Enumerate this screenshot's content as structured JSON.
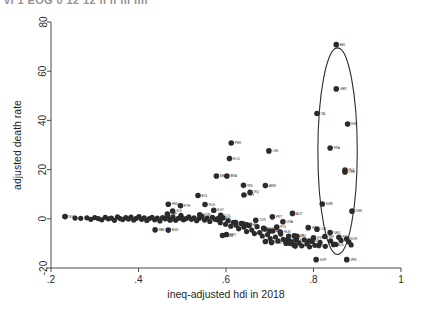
{
  "figure": {
    "cropped_top_text": "vi   1 EOG  0 12 12 ii ii  iii iiii",
    "plot_type": "scatter"
  },
  "chart_data": {
    "type": "scatter",
    "title": "",
    "xlabel": "ineq-adjusted hdi in 2018",
    "ylabel": "adjusted death rate",
    "xlim": [
      0.2,
      1.0
    ],
    "ylim": [
      -20,
      80
    ],
    "xticks": [
      ".2",
      ".4",
      ".6",
      ".8",
      "1"
    ],
    "xtick_values": [
      0.2,
      0.4,
      0.6,
      0.8,
      1.0
    ],
    "yticks": [
      "-20",
      "0",
      "20",
      "40",
      "60",
      "80"
    ],
    "ytick_values": [
      -20,
      0,
      20,
      40,
      60,
      80
    ],
    "grid": false,
    "legend": "none",
    "marker_color": "#2b2b2b",
    "annotation": {
      "shape": "ellipse",
      "label": "",
      "cx": 0.855,
      "cy": 27.5,
      "rx": 0.045,
      "ry": 42.0,
      "stroke": "#2b2b2b"
    },
    "points": [
      {
        "label": "BEL",
        "x": 0.852,
        "y": 70.8
      },
      {
        "label": "GBR",
        "x": 0.852,
        "y": 52.8
      },
      {
        "label": "ITA",
        "x": 0.808,
        "y": 42.8
      },
      {
        "label": "ESP",
        "x": 0.878,
        "y": 38.5
      },
      {
        "label": "PER",
        "x": 0.612,
        "y": 30.8
      },
      {
        "label": "FRA",
        "x": 0.838,
        "y": 28.8
      },
      {
        "label": "CHL",
        "x": 0.698,
        "y": 27.6
      },
      {
        "label": "ECU",
        "x": 0.608,
        "y": 24.5
      },
      {
        "label": "NLD",
        "x": 0.872,
        "y": 19.8
      },
      {
        "label": "CHE",
        "x": 0.872,
        "y": 19.0
      },
      {
        "label": "MEX",
        "x": 0.578,
        "y": 17.4
      },
      {
        "label": "BRA",
        "x": 0.602,
        "y": 17.4
      },
      {
        "label": "IRN",
        "x": 0.64,
        "y": 13.6
      },
      {
        "label": "ARM",
        "x": 0.69,
        "y": 13.5
      },
      {
        "label": "IRQ",
        "x": 0.655,
        "y": 10.8
      },
      {
        "label": "PAN",
        "x": 0.641,
        "y": 9.7
      },
      {
        "label": "BOL",
        "x": 0.536,
        "y": 9.5
      },
      {
        "label": "SWE",
        "x": 0.82,
        "y": 6.0
      },
      {
        "label": "HND",
        "x": 0.468,
        "y": 5.9
      },
      {
        "label": "RUS",
        "x": 0.552,
        "y": 5.8
      },
      {
        "label": "ETH",
        "x": 0.496,
        "y": 5.3
      },
      {
        "label": "EGY",
        "x": 0.572,
        "y": 3.5
      },
      {
        "label": "SLV",
        "x": 0.478,
        "y": 3.2
      },
      {
        "label": "DNK",
        "x": 0.888,
        "y": 3.1
      },
      {
        "label": "AUT",
        "x": 0.752,
        "y": 2.2
      },
      {
        "label": "ZAF",
        "x": 0.466,
        "y": 1.9
      },
      {
        "label": "GTM",
        "x": 0.54,
        "y": 1.6
      },
      {
        "label": "COL",
        "x": 0.588,
        "y": 1.4
      },
      {
        "label": "NGA",
        "x": 0.232,
        "y": 0.9
      },
      {
        "label": "PRT",
        "x": 0.706,
        "y": 0.8
      },
      {
        "label": "IDN",
        "x": 0.59,
        "y": 0.2
      },
      {
        "label": "MAR",
        "x": 0.5,
        "y": 0.1
      },
      {
        "label": "PHL",
        "x": 0.582,
        "y": -0.4
      },
      {
        "label": "IND",
        "x": 0.472,
        "y": -0.5
      },
      {
        "label": "TUR",
        "x": 0.668,
        "y": -0.6
      },
      {
        "label": "USA",
        "x": 0.73,
        "y": -1.2
      },
      {
        "label": "UKR",
        "x": 0.622,
        "y": -1.5
      },
      {
        "label": "THA",
        "x": 0.637,
        "y": -2.0
      },
      {
        "label": "CHN",
        "x": 0.647,
        "y": -2.4
      },
      {
        "label": "POL",
        "x": 0.716,
        "y": -3.4
      },
      {
        "label": "IRL",
        "x": 0.788,
        "y": -3.6
      },
      {
        "label": "RUS2",
        "x": 0.686,
        "y": -3.9
      },
      {
        "label": "LUX",
        "x": 0.808,
        "y": -4.2
      },
      {
        "label": "PAK",
        "x": 0.438,
        "y": -4.5
      },
      {
        "label": "BGD",
        "x": 0.468,
        "y": -4.6
      },
      {
        "label": "KAZ",
        "x": 0.7,
        "y": -5.0
      },
      {
        "label": "HUN",
        "x": 0.724,
        "y": -5.4
      },
      {
        "label": "DEU",
        "x": 0.838,
        "y": -5.6
      },
      {
        "label": "PRY",
        "x": 0.601,
        "y": -6.4
      },
      {
        "label": "VNM",
        "x": 0.592,
        "y": -6.8
      },
      {
        "label": "CZE",
        "x": 0.756,
        "y": -6.9
      },
      {
        "label": "LTU",
        "x": 0.762,
        "y": -7.1
      },
      {
        "label": "ISR",
        "x": 0.826,
        "y": -7.2
      },
      {
        "label": "FIN",
        "x": 0.858,
        "y": -7.5
      },
      {
        "label": "SVN",
        "x": 0.8,
        "y": -7.7
      },
      {
        "label": "NOR",
        "x": 0.876,
        "y": -8.2
      },
      {
        "label": "GRC",
        "x": 0.742,
        "y": -8.3
      },
      {
        "label": "SVK",
        "x": 0.76,
        "y": -8.6
      },
      {
        "label": "HRV",
        "x": 0.736,
        "y": -8.9
      },
      {
        "label": "EST",
        "x": 0.79,
        "y": -9.0
      },
      {
        "label": "BGR",
        "x": 0.69,
        "y": -9.2
      },
      {
        "label": "ROU",
        "x": 0.704,
        "y": -9.6
      },
      {
        "label": "LVA",
        "x": 0.746,
        "y": -9.9
      },
      {
        "label": "AUS",
        "x": 0.846,
        "y": -10.4
      },
      {
        "label": "NZL",
        "x": 0.812,
        "y": -10.9
      },
      {
        "label": "KOR",
        "x": 0.758,
        "y": -11.1
      },
      {
        "label": "SGP",
        "x": 0.806,
        "y": -16.6
      },
      {
        "label": "JPN",
        "x": 0.876,
        "y": -16.6
      }
    ],
    "band_points": [
      {
        "x": 0.232,
        "y": 0.9
      },
      {
        "x": 0.255,
        "y": 0.3
      },
      {
        "x": 0.268,
        "y": 0.2
      },
      {
        "x": 0.282,
        "y": 0.4
      },
      {
        "x": 0.291,
        "y": -0.2
      },
      {
        "x": 0.3,
        "y": 0.5
      },
      {
        "x": 0.308,
        "y": 0.1
      },
      {
        "x": 0.316,
        "y": -0.4
      },
      {
        "x": 0.324,
        "y": 0.6
      },
      {
        "x": 0.331,
        "y": 0.0
      },
      {
        "x": 0.338,
        "y": 0.3
      },
      {
        "x": 0.345,
        "y": -0.6
      },
      {
        "x": 0.352,
        "y": 0.8
      },
      {
        "x": 0.358,
        "y": 0.1
      },
      {
        "x": 0.364,
        "y": -0.3
      },
      {
        "x": 0.371,
        "y": 0.5
      },
      {
        "x": 0.377,
        "y": -0.1
      },
      {
        "x": 0.383,
        "y": 0.7
      },
      {
        "x": 0.389,
        "y": -0.5
      },
      {
        "x": 0.395,
        "y": 0.2
      },
      {
        "x": 0.401,
        "y": 0.9
      },
      {
        "x": 0.407,
        "y": -0.2
      },
      {
        "x": 0.413,
        "y": 0.4
      },
      {
        "x": 0.419,
        "y": -0.7
      },
      {
        "x": 0.425,
        "y": 0.1
      },
      {
        "x": 0.431,
        "y": 0.6
      },
      {
        "x": 0.437,
        "y": -0.4
      },
      {
        "x": 0.443,
        "y": 0.3
      },
      {
        "x": 0.449,
        "y": -0.9
      },
      {
        "x": 0.455,
        "y": 0.5
      },
      {
        "x": 0.461,
        "y": 0.0
      },
      {
        "x": 0.467,
        "y": 1.2
      },
      {
        "x": 0.473,
        "y": -0.3
      },
      {
        "x": 0.479,
        "y": 0.7
      },
      {
        "x": 0.485,
        "y": -0.6
      },
      {
        "x": 0.491,
        "y": 0.2
      },
      {
        "x": 0.497,
        "y": 1.4
      },
      {
        "x": 0.503,
        "y": -0.4
      },
      {
        "x": 0.509,
        "y": 0.1
      },
      {
        "x": 0.515,
        "y": 0.8
      },
      {
        "x": 0.521,
        "y": -0.2
      },
      {
        "x": 0.527,
        "y": 0.4
      },
      {
        "x": 0.533,
        "y": -0.8
      },
      {
        "x": 0.539,
        "y": 0.2
      },
      {
        "x": 0.545,
        "y": 1.0
      },
      {
        "x": 0.551,
        "y": -0.5
      },
      {
        "x": 0.557,
        "y": 0.3
      },
      {
        "x": 0.563,
        "y": -1.1
      },
      {
        "x": 0.569,
        "y": 0.6
      },
      {
        "x": 0.575,
        "y": -0.2
      },
      {
        "x": 0.581,
        "y": 0.1
      },
      {
        "x": 0.587,
        "y": -1.6
      },
      {
        "x": 0.593,
        "y": 0.5
      },
      {
        "x": 0.599,
        "y": -2.2
      },
      {
        "x": 0.605,
        "y": -0.8
      },
      {
        "x": 0.611,
        "y": -3.0
      },
      {
        "x": 0.617,
        "y": -1.4
      },
      {
        "x": 0.623,
        "y": -2.6
      },
      {
        "x": 0.629,
        "y": -4.0
      },
      {
        "x": 0.635,
        "y": -1.9
      },
      {
        "x": 0.641,
        "y": -3.4
      },
      {
        "x": 0.647,
        "y": -5.2
      },
      {
        "x": 0.653,
        "y": -2.8
      },
      {
        "x": 0.659,
        "y": -4.6
      },
      {
        "x": 0.665,
        "y": -6.0
      },
      {
        "x": 0.671,
        "y": -3.2
      },
      {
        "x": 0.677,
        "y": -5.6
      },
      {
        "x": 0.683,
        "y": -7.0
      },
      {
        "x": 0.689,
        "y": -4.2
      },
      {
        "x": 0.695,
        "y": -6.4
      },
      {
        "x": 0.701,
        "y": -8.0
      },
      {
        "x": 0.707,
        "y": -5.0
      },
      {
        "x": 0.713,
        "y": -7.4
      },
      {
        "x": 0.719,
        "y": -9.0
      },
      {
        "x": 0.725,
        "y": -6.2
      },
      {
        "x": 0.731,
        "y": -8.4
      },
      {
        "x": 0.737,
        "y": -10.0
      },
      {
        "x": 0.743,
        "y": -7.0
      },
      {
        "x": 0.749,
        "y": -9.4
      },
      {
        "x": 0.755,
        "y": -10.6
      },
      {
        "x": 0.761,
        "y": -8.0
      },
      {
        "x": 0.767,
        "y": -9.8
      },
      {
        "x": 0.773,
        "y": -11.0
      },
      {
        "x": 0.779,
        "y": -8.6
      },
      {
        "x": 0.785,
        "y": -10.2
      },
      {
        "x": 0.791,
        "y": -11.4
      },
      {
        "x": 0.797,
        "y": -9.2
      },
      {
        "x": 0.803,
        "y": -10.8
      },
      {
        "x": 0.815,
        "y": -9.6
      },
      {
        "x": 0.827,
        "y": -11.2
      },
      {
        "x": 0.839,
        "y": -9.0
      },
      {
        "x": 0.851,
        "y": -10.4
      },
      {
        "x": 0.863,
        "y": -8.8
      },
      {
        "x": 0.881,
        "y": -9.4
      },
      {
        "x": 0.886,
        "y": -10.6
      }
    ]
  }
}
